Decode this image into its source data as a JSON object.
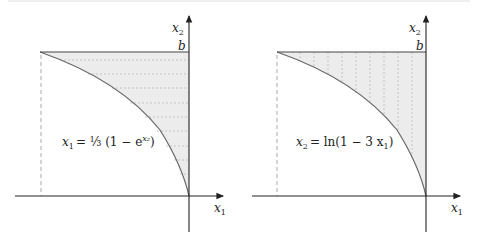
{
  "diagrams": [
    {
      "name": "horizontal-strips",
      "axis_x_label": "x",
      "axis_x_sub": "1",
      "axis_y_label": "x",
      "axis_y_sub": "2",
      "top_label": "b",
      "equation_lhs": "x",
      "equation_lhs_sub": "1",
      "equation_rhs": "= ⅓ (1 − e",
      "equation_exp": "x₂",
      "equation_close": ")"
    },
    {
      "name": "vertical-strips",
      "axis_x_label": "x",
      "axis_x_sub": "1",
      "axis_y_label": "x",
      "axis_y_sub": "2",
      "top_label": "b",
      "equation_text": "= ln(1 − 3 x",
      "equation_lhs": "x",
      "equation_lhs_sub": "2",
      "equation_rhs_sub": "1",
      "equation_close": ")"
    }
  ],
  "colors": {
    "fill": "#ececec",
    "axis": "#222222",
    "curve": "#666666",
    "dash": "#aaaaaa"
  }
}
